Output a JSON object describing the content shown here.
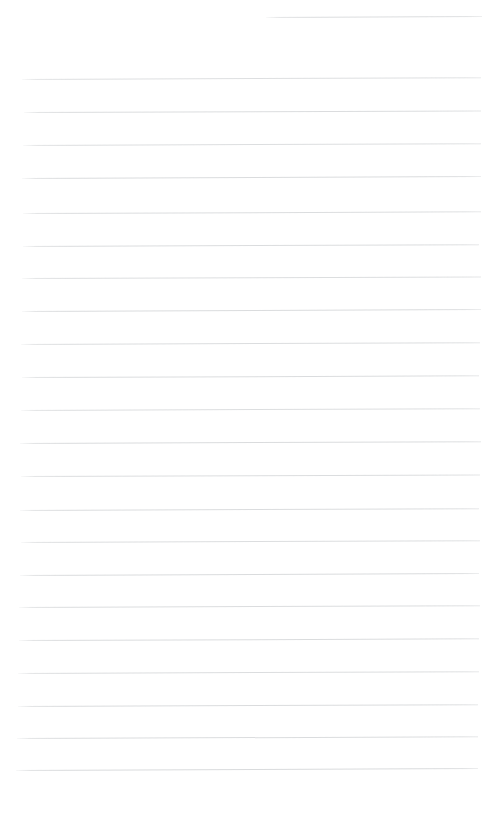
{
  "document": {
    "type": "scanned-ruled-paper",
    "title": "Blank Ruled Notebook Page",
    "page_width": 502,
    "page_height": 813,
    "background_color": "#ffffff",
    "rule_color": "#d5d7d9",
    "rule_thickness_px": 1,
    "rule_count": 23,
    "rule_spacing_px": 32.7,
    "text_content": "",
    "has_handwriting": "no",
    "margin_left_px": 22,
    "margin_right_px": 481,
    "rules": [
      {
        "id": "rule-01",
        "y": 17,
        "x1": 266,
        "x2": 482,
        "tilt_deg": -0.25,
        "opacity": 0.85,
        "short": true
      },
      {
        "id": "rule-02",
        "y": 79,
        "x1": 22,
        "x2": 481,
        "tilt_deg": -0.22,
        "opacity": 0.8,
        "short": false
      },
      {
        "id": "rule-03",
        "y": 112,
        "x1": 24,
        "x2": 481,
        "tilt_deg": -0.2,
        "opacity": 0.85,
        "short": false
      },
      {
        "id": "rule-04",
        "y": 145,
        "x1": 23,
        "x2": 481,
        "tilt_deg": -0.22,
        "opacity": 0.82,
        "short": false
      },
      {
        "id": "rule-05",
        "y": 178,
        "x1": 22,
        "x2": 481,
        "tilt_deg": -0.24,
        "opacity": 0.88,
        "short": false
      },
      {
        "id": "rule-06",
        "y": 213,
        "x1": 23,
        "x2": 481,
        "tilt_deg": -0.21,
        "opacity": 0.84,
        "short": false
      },
      {
        "id": "rule-07",
        "y": 246,
        "x1": 23,
        "x2": 479,
        "tilt_deg": -0.23,
        "opacity": 0.86,
        "short": false
      },
      {
        "id": "rule-08",
        "y": 278,
        "x1": 22,
        "x2": 481,
        "tilt_deg": -0.2,
        "opacity": 0.82,
        "short": false
      },
      {
        "id": "rule-09",
        "y": 311,
        "x1": 22,
        "x2": 481,
        "tilt_deg": -0.24,
        "opacity": 0.88,
        "short": false
      },
      {
        "id": "rule-10",
        "y": 344,
        "x1": 21,
        "x2": 480,
        "tilt_deg": -0.22,
        "opacity": 0.84,
        "short": false
      },
      {
        "id": "rule-11",
        "y": 377,
        "x1": 22,
        "x2": 479,
        "tilt_deg": -0.21,
        "opacity": 0.86,
        "short": false
      },
      {
        "id": "rule-12",
        "y": 410,
        "x1": 21,
        "x2": 480,
        "tilt_deg": -0.23,
        "opacity": 0.82,
        "short": false
      },
      {
        "id": "rule-13",
        "y": 443,
        "x1": 20,
        "x2": 481,
        "tilt_deg": -0.22,
        "opacity": 0.88,
        "short": false
      },
      {
        "id": "rule-14",
        "y": 476,
        "x1": 21,
        "x2": 480,
        "tilt_deg": -0.2,
        "opacity": 0.84,
        "short": false
      },
      {
        "id": "rule-15",
        "y": 510,
        "x1": 20,
        "x2": 479,
        "tilt_deg": -0.23,
        "opacity": 0.86,
        "short": false
      },
      {
        "id": "rule-16",
        "y": 542,
        "x1": 21,
        "x2": 480,
        "tilt_deg": -0.22,
        "opacity": 0.83,
        "short": false
      },
      {
        "id": "rule-17",
        "y": 575,
        "x1": 20,
        "x2": 479,
        "tilt_deg": -0.24,
        "opacity": 0.88,
        "short": false
      },
      {
        "id": "rule-18",
        "y": 607,
        "x1": 19,
        "x2": 480,
        "tilt_deg": -0.22,
        "opacity": 0.85,
        "short": false
      },
      {
        "id": "rule-19",
        "y": 640,
        "x1": 19,
        "x2": 479,
        "tilt_deg": -0.21,
        "opacity": 0.87,
        "short": false
      },
      {
        "id": "rule-20",
        "y": 673,
        "x1": 18,
        "x2": 479,
        "tilt_deg": -0.23,
        "opacity": 0.84,
        "short": false
      },
      {
        "id": "rule-21",
        "y": 706,
        "x1": 18,
        "x2": 478,
        "tilt_deg": -0.22,
        "opacity": 0.88,
        "short": false
      },
      {
        "id": "rule-22",
        "y": 738,
        "x1": 17,
        "x2": 478,
        "tilt_deg": -0.21,
        "opacity": 0.86,
        "short": false
      },
      {
        "id": "rule-23",
        "y": 770,
        "x1": 16,
        "x2": 478,
        "tilt_deg": -0.24,
        "opacity": 0.9,
        "short": false
      }
    ]
  }
}
